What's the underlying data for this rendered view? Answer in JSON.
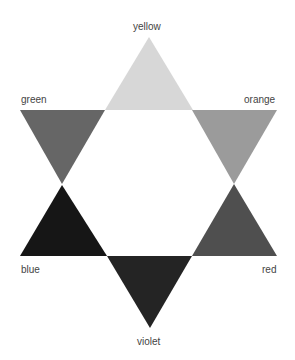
{
  "diagram": {
    "type": "color-wheel-star",
    "segments": [
      {
        "name": "yellow",
        "label": "yellow",
        "color": "#d7d7d7",
        "points": "149,37 105,110 193,110"
      },
      {
        "name": "orange",
        "label": "orange",
        "color": "#9b9b9b",
        "points": "192,110 277,110 234,184"
      },
      {
        "name": "red",
        "label": "red",
        "color": "#4f4f4f",
        "points": "234,184 277,256 192,256"
      },
      {
        "name": "violet",
        "label": "violet",
        "color": "#242424",
        "points": "107,256 192,256 150,328"
      },
      {
        "name": "blue",
        "label": "blue",
        "color": "#161616",
        "points": "62,185 107,256 20,256"
      },
      {
        "name": "green",
        "label": "green",
        "color": "#666666",
        "points": "20,110 105,110 62,184"
      }
    ]
  }
}
